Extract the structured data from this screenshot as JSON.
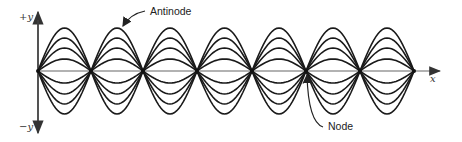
{
  "diagram": {
    "labels": {
      "antinode": "Antinode",
      "node": "Node",
      "pos_y": "+y",
      "neg_y": "−y",
      "x": "x"
    },
    "nodes_x": [
      38,
      91,
      143,
      197,
      252,
      306,
      360,
      414
    ],
    "axis_y": 71,
    "amplitudes": [
      43,
      33,
      23,
      12
    ],
    "stroke_color": "#1a1a1a",
    "axis_color": "#555555"
  }
}
